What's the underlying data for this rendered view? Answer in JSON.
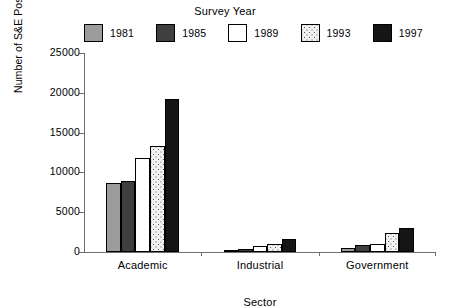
{
  "chart_data": {
    "type": "bar",
    "title": "",
    "legend_title": "Survey Year",
    "legend_position": "top",
    "xlabel": "Sector",
    "ylabel": "Number of S&E Postdoctoral Appointments",
    "categories": [
      "Academic",
      "Industrial",
      "Government"
    ],
    "ylim": [
      0,
      25000
    ],
    "yticks": [
      0,
      5000,
      10000,
      15000,
      20000,
      25000
    ],
    "ytick_labels": [
      "0",
      "5000",
      "10000",
      "15000",
      "20000",
      "25000"
    ],
    "grid": false,
    "series": [
      {
        "name": "1981",
        "fill": "grey",
        "color": "#9c9c9c",
        "values": [
          8700,
          200,
          550
        ]
      },
      {
        "name": "1985",
        "fill": "darkgrey",
        "color": "#3f3f3f",
        "values": [
          8900,
          400,
          900
        ]
      },
      {
        "name": "1989",
        "fill": "white",
        "color": "#ffffff",
        "values": [
          11800,
          700,
          1000
        ]
      },
      {
        "name": "1993",
        "fill": "dots",
        "color": "#f2f2f2",
        "values": [
          13300,
          1000,
          2400
        ]
      },
      {
        "name": "1997",
        "fill": "black",
        "color": "#151515",
        "values": [
          19200,
          1600,
          3000
        ]
      }
    ]
  },
  "legend": {
    "title": "Survey Year",
    "items": [
      {
        "label": "1981",
        "fill": "grey"
      },
      {
        "label": "1985",
        "fill": "darkgrey"
      },
      {
        "label": "1989",
        "fill": "white"
      },
      {
        "label": "1993",
        "fill": "dots"
      },
      {
        "label": "1997",
        "fill": "black"
      }
    ]
  },
  "axes": {
    "ylabel": "Number of S&E Postdoctoral Appointments",
    "xlabel": "Sector",
    "ytick_labels": [
      "25000",
      "20000",
      "15000",
      "10000",
      "5000",
      "0"
    ],
    "group_labels": [
      "Academic",
      "Industrial",
      "Government"
    ]
  }
}
